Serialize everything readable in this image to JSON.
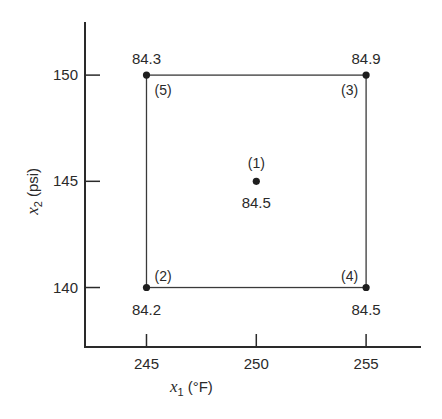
{
  "chart_data": {
    "type": "scatter",
    "title": "",
    "xlabel": {
      "var": "x",
      "sub": "1",
      "unit": "(°F)"
    },
    "ylabel": {
      "var": "x",
      "sub": "2",
      "unit": "(psi)"
    },
    "xlim": [
      242.2,
      257.5
    ],
    "ylim": [
      137.2,
      152.5
    ],
    "xticks": [
      245,
      250,
      255
    ],
    "yticks": [
      140,
      145,
      150
    ],
    "xtick_labels": [
      "245",
      "250",
      "255"
    ],
    "ytick_labels": [
      "140",
      "145",
      "150"
    ],
    "grid": false,
    "design_box": {
      "x": [
        245,
        255
      ],
      "y": [
        140,
        150
      ]
    },
    "points": [
      {
        "run": "(1)",
        "x": 250,
        "y": 145,
        "value": "84.5",
        "run_pos": "above",
        "value_pos": "below"
      },
      {
        "run": "(2)",
        "x": 245,
        "y": 140,
        "value": "84.2",
        "run_pos": "upper-right",
        "value_pos": "below"
      },
      {
        "run": "(3)",
        "x": 255,
        "y": 150,
        "value": "84.9",
        "run_pos": "lower-left",
        "value_pos": "above"
      },
      {
        "run": "(4)",
        "x": 255,
        "y": 140,
        "value": "84.5",
        "run_pos": "upper-left",
        "value_pos": "below"
      },
      {
        "run": "(5)",
        "x": 245,
        "y": 150,
        "value": "84.3",
        "run_pos": "lower-right",
        "value_pos": "above"
      }
    ]
  }
}
